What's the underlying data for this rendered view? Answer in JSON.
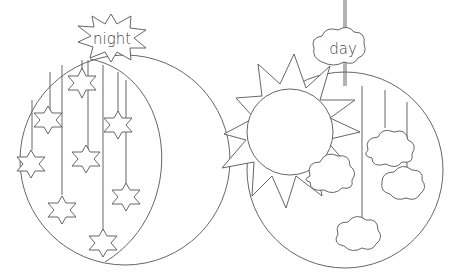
{
  "night_ornament": {
    "label": "night",
    "star_count": 9
  },
  "day_ornament": {
    "label": "day",
    "cloud_count": 5
  },
  "colors": {
    "line": "#555555",
    "background": "#ffffff"
  }
}
